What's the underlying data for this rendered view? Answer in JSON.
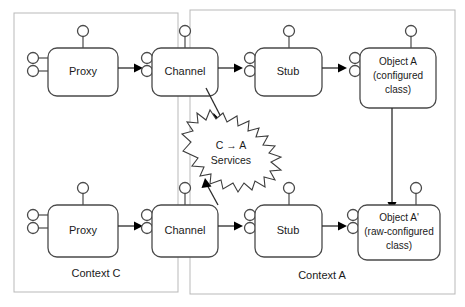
{
  "diagram": {
    "colors": {
      "context_border": "#b9b9b9",
      "component_border": "#4a4a4a",
      "connector": "#2b2b2b",
      "burst_border": "#3d3d3d",
      "background": "#ffffff",
      "text": "#1a1a1a"
    },
    "contexts": [
      {
        "id": "context-c",
        "label": "Context C"
      },
      {
        "id": "context-a",
        "label": "Context A"
      }
    ],
    "components": [
      {
        "id": "proxy-top",
        "label": "Proxy",
        "lines": [
          "Proxy"
        ]
      },
      {
        "id": "channel-top",
        "label": "Channel",
        "lines": [
          "Channel"
        ]
      },
      {
        "id": "stub-top",
        "label": "Stub",
        "lines": [
          "Stub"
        ]
      },
      {
        "id": "object-a",
        "label": "Object A (configured class)",
        "lines": [
          "Object A",
          "(configured",
          "class)"
        ]
      },
      {
        "id": "proxy-bottom",
        "label": "Proxy",
        "lines": [
          "Proxy"
        ]
      },
      {
        "id": "channel-bottom",
        "label": "Channel",
        "lines": [
          "Channel"
        ]
      },
      {
        "id": "stub-bottom",
        "label": "Stub",
        "lines": [
          "Stub"
        ]
      },
      {
        "id": "object-a-prime",
        "label": "Object A' (raw-configured class)",
        "lines": [
          "Object A'",
          "(raw-configured",
          "class)"
        ]
      }
    ],
    "services_burst": {
      "id": "services-burst",
      "lines": [
        "C → A",
        "Services"
      ],
      "line1": "C → A",
      "line2": "Services"
    }
  }
}
